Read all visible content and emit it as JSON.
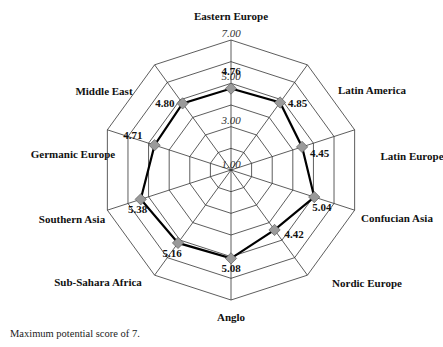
{
  "chart_data": {
    "type": "radar",
    "title": "",
    "categories": [
      "Eastern Europe",
      "Latin America",
      "Latin Europe",
      "Confucian Asia",
      "Nordic Europe",
      "Anglo",
      "Sub-Sahara Africa",
      "Southern Asia",
      "Germanic Europe",
      "Middle East"
    ],
    "values": [
      4.76,
      4.85,
      4.45,
      5.04,
      4.42,
      5.08,
      5.16,
      5.38,
      4.71,
      4.8
    ],
    "value_labels": [
      "4.76",
      "4.85",
      "4.45",
      "5.04",
      "4.42",
      "5.08",
      "5.16",
      "5.38",
      "4.71",
      "4.80"
    ],
    "rlim": [
      1,
      7
    ],
    "ticks": [
      "1.00",
      "3.00",
      "5.00",
      "7.00"
    ],
    "grid": true,
    "rings": 6
  },
  "caption": "Maximum potential score of 7.",
  "colors": {
    "line": "#000000",
    "marker": "#9a9a9a",
    "grid": "#333333"
  }
}
